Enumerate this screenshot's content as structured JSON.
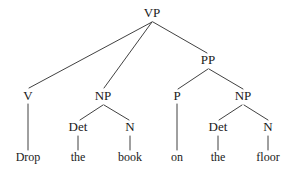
{
  "figure": {
    "kind": "syntax-tree",
    "sentence": "Drop the book on the floor",
    "background_color": "#ffffff",
    "line_color": "#2b2b2b",
    "text_color": "#1a1a1a",
    "width": 295,
    "height": 172
  },
  "nodes": [
    {
      "id": "vp",
      "label": "VP",
      "type": "category",
      "x": 152,
      "y": 17
    },
    {
      "id": "pp",
      "label": "PP",
      "type": "category",
      "x": 208,
      "y": 64
    },
    {
      "id": "v",
      "label": "V",
      "type": "category",
      "x": 28,
      "y": 100
    },
    {
      "id": "np1",
      "label": "NP",
      "type": "category",
      "x": 103,
      "y": 100
    },
    {
      "id": "p",
      "label": "P",
      "type": "category",
      "x": 177,
      "y": 100
    },
    {
      "id": "np2",
      "label": "NP",
      "type": "category",
      "x": 243,
      "y": 100
    },
    {
      "id": "det1",
      "label": "Det",
      "type": "category",
      "x": 78,
      "y": 131
    },
    {
      "id": "n1",
      "label": "N",
      "type": "category",
      "x": 130,
      "y": 131
    },
    {
      "id": "det2",
      "label": "Det",
      "type": "category",
      "x": 218,
      "y": 131
    },
    {
      "id": "n2",
      "label": "N",
      "type": "category",
      "x": 268,
      "y": 131
    },
    {
      "id": "drop",
      "label": "Drop",
      "type": "terminal",
      "x": 28,
      "y": 161
    },
    {
      "id": "the1",
      "label": "the",
      "type": "terminal",
      "x": 78,
      "y": 161
    },
    {
      "id": "book",
      "label": "book",
      "type": "terminal",
      "x": 130,
      "y": 161
    },
    {
      "id": "on",
      "label": "on",
      "type": "terminal",
      "x": 177,
      "y": 161
    },
    {
      "id": "the2",
      "label": "the",
      "type": "terminal",
      "x": 218,
      "y": 161
    },
    {
      "id": "floor",
      "label": "floor",
      "type": "terminal",
      "x": 268,
      "y": 161
    }
  ],
  "edges": [
    {
      "id": "vp-v",
      "from": "vp",
      "to": "v",
      "x1": 152,
      "y1": 22,
      "x2": 29,
      "y2": 88
    },
    {
      "id": "vp-np1",
      "from": "vp",
      "to": "np1",
      "x1": 152,
      "y1": 22,
      "x2": 104,
      "y2": 88
    },
    {
      "id": "vp-pp",
      "from": "vp",
      "to": "pp",
      "x1": 153,
      "y1": 22,
      "x2": 207,
      "y2": 53
    },
    {
      "id": "pp-p",
      "from": "pp",
      "to": "p",
      "x1": 208,
      "y1": 69,
      "x2": 178,
      "y2": 89
    },
    {
      "id": "pp-np2",
      "from": "pp",
      "to": "np2",
      "x1": 209,
      "y1": 69,
      "x2": 243,
      "y2": 89
    },
    {
      "id": "np1-det1",
      "from": "np1",
      "to": "det1",
      "x1": 103,
      "y1": 105,
      "x2": 80,
      "y2": 120
    },
    {
      "id": "np1-n1",
      "from": "np1",
      "to": "n1",
      "x1": 104,
      "y1": 105,
      "x2": 129,
      "y2": 120
    },
    {
      "id": "np2-det2",
      "from": "np2",
      "to": "det2",
      "x1": 242,
      "y1": 105,
      "x2": 219,
      "y2": 120
    },
    {
      "id": "np2-n2",
      "from": "np2",
      "to": "n2",
      "x1": 244,
      "y1": 105,
      "x2": 268,
      "y2": 120
    },
    {
      "id": "v-drop",
      "from": "v",
      "to": "drop",
      "x1": 28,
      "y1": 104,
      "x2": 28,
      "y2": 150
    },
    {
      "id": "det1-the1",
      "from": "det1",
      "to": "the1",
      "x1": 78,
      "y1": 136,
      "x2": 78,
      "y2": 150
    },
    {
      "id": "n1-book",
      "from": "n1",
      "to": "book",
      "x1": 130,
      "y1": 136,
      "x2": 130,
      "y2": 150
    },
    {
      "id": "p-on",
      "from": "p",
      "to": "on",
      "x1": 177,
      "y1": 104,
      "x2": 177,
      "y2": 150
    },
    {
      "id": "det2-the2",
      "from": "det2",
      "to": "the2",
      "x1": 218,
      "y1": 136,
      "x2": 218,
      "y2": 150
    },
    {
      "id": "n2-floor",
      "from": "n2",
      "to": "floor",
      "x1": 268,
      "y1": 136,
      "x2": 268,
      "y2": 150
    }
  ]
}
